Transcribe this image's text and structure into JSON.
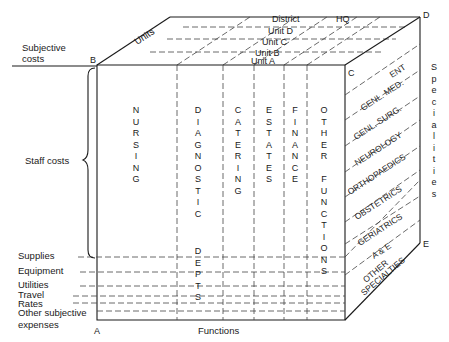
{
  "diagram": {
    "corners": {
      "A": "A",
      "B": "B",
      "C": "C",
      "D": "D",
      "E": "E"
    },
    "axes": {
      "top": "Units",
      "bottom": "Functions",
      "right": "Specialities",
      "left_top": "Subjective costs"
    },
    "units": [
      "District",
      "HQ",
      "Unit D",
      "Unit C",
      "Unit B",
      "Unit A"
    ],
    "functions": [
      "NURSING",
      "DIAGNOSTIC DEPTS",
      "CATERING",
      "ESTATES",
      "FINANCE",
      "OTHER FUNCTIONS"
    ],
    "specialities": [
      "ENT",
      "GENL. MED.",
      "GENL. SURG.",
      "NEUROLOGY",
      "ORTHOPAEDICS",
      "OBSTETRICS",
      "GERIATRICS",
      "A & E",
      "OTHER SPECIALTIES"
    ],
    "subjective_costs": {
      "staff": "Staff costs",
      "rows": [
        "Supplies",
        "Equipment",
        "Utilities",
        "Travel",
        "Rates",
        "Other subjective expenses"
      ]
    },
    "vertical_labels": {
      "nursing": "NURSING",
      "diagnostic": "DIAGNOSTIC",
      "depts": "DEPTS",
      "catering": "CATERING",
      "estates": "ESTATES",
      "finance": "FINANCE",
      "other": "OTHER",
      "functions": "FUNCTIONS",
      "specialities": "Specialities"
    },
    "row_labels": {
      "subjective_1": "Subjective",
      "subjective_2": "costs",
      "other_1": "Other subjective",
      "other_2": "expenses",
      "other_spec_1": "OTHER",
      "other_spec_2": "SPECIALTIES"
    }
  }
}
